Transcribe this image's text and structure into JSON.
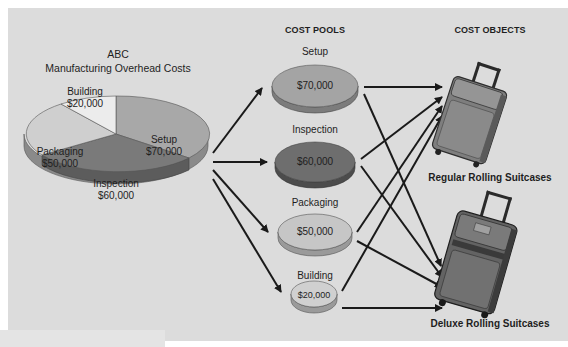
{
  "title": {
    "line1": "ABC",
    "line2": "Manufacturing Overhead Costs"
  },
  "pie": {
    "slices": [
      {
        "name": "Setup",
        "value": "$70,000",
        "color": "#a8a8a8"
      },
      {
        "name": "Inspection",
        "value": "$60,000",
        "color": "#7a7a7a"
      },
      {
        "name": "Packaging",
        "value": "$50,000",
        "color": "#cfcfcf"
      },
      {
        "name": "Building",
        "value": "$20,000",
        "color": "#e8e8e8"
      }
    ]
  },
  "cost_pools": {
    "header": "COST POOLS",
    "items": [
      {
        "name": "Setup",
        "value": "$70,000",
        "color": "#a4a4a4"
      },
      {
        "name": "Inspection",
        "value": "$60,000",
        "color": "#6e6e6e"
      },
      {
        "name": "Packaging",
        "value": "$50,000",
        "color": "#c6c6c6"
      },
      {
        "name": "Building",
        "value": "$20,000",
        "color": "#d0d0d0"
      }
    ]
  },
  "cost_objects": {
    "header": "COST OBJECTS",
    "items": [
      {
        "name": "Regular Rolling Suitcases"
      },
      {
        "name": "Deluxe Rolling Suitcases"
      }
    ]
  }
}
